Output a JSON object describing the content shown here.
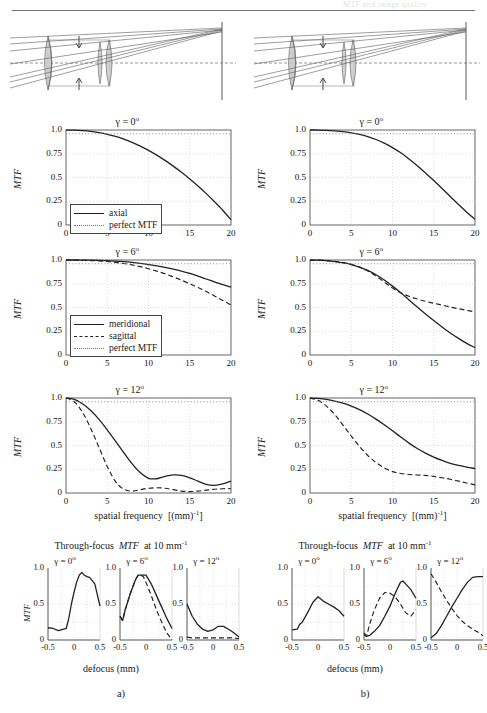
{
  "header": {
    "ghost_text": "MTF and image quality"
  },
  "figure": {
    "panels": [
      {
        "id": "a",
        "label": "a)"
      },
      {
        "id": "b",
        "label": "b)"
      }
    ],
    "axis": {
      "y_label": "MTF",
      "x_label_freq_pre": "spatial  frequency",
      "x_label_freq_unit": "[(mm)",
      "x_label_freq_exp": "-1",
      "x_label_freq_post": "]",
      "x_label_defocus": "defocus (mm)",
      "y_ticks": [
        "0",
        "0.25",
        "0.5",
        "0.75",
        "1.0"
      ],
      "x_ticks_freq": [
        "0",
        "5",
        "10",
        "15",
        "20"
      ],
      "y_ticks_tf": [
        "0",
        "0.5",
        "1.0"
      ],
      "x_ticks_tf": [
        "-0.5",
        "0",
        "0.5"
      ]
    },
    "titles": {
      "gamma0": "γ = 0",
      "gamma6": "γ = 6",
      "gamma12": "γ = 12",
      "degree": "o",
      "through_focus_pre": "Through-focus",
      "through_focus_mid": "MTF",
      "through_focus_post": "at  10  mm",
      "through_focus_exp": "-1"
    },
    "legends": {
      "axial": [
        {
          "style": "solid",
          "label": "axial"
        },
        {
          "style": "dot",
          "label": "perfect MTF"
        }
      ],
      "offaxis": [
        {
          "style": "solid",
          "label": "meridional"
        },
        {
          "style": "dash",
          "label": "sagittal"
        },
        {
          "style": "dot",
          "label": "perfect MTF"
        }
      ]
    },
    "colors": {
      "curve": "#222222",
      "perfect": "#8d8d8d",
      "grid": "#cfcfcf",
      "axis": "#555555",
      "lens_glass": "#c9c9c9",
      "lens_outline": "#6b6b6b",
      "ray": "#5c5c5c"
    }
  },
  "chart_data": [
    {
      "id": "a-gamma0",
      "type": "line",
      "title": "γ = 0°",
      "xlabel": "spatial frequency [(mm)^-1]",
      "ylabel": "MTF",
      "xlim": [
        0,
        20
      ],
      "ylim": [
        0,
        1
      ],
      "grid": true,
      "legend_position": "inside-bottom-left",
      "x": [
        0,
        1,
        2,
        3,
        4,
        5,
        6,
        7,
        8,
        9,
        10,
        11,
        12,
        13,
        14,
        15,
        16,
        17,
        18,
        19,
        20
      ],
      "series": [
        {
          "name": "axial",
          "style": "solid",
          "values": [
            1.0,
            0.998,
            0.993,
            0.985,
            0.972,
            0.955,
            0.932,
            0.904,
            0.87,
            0.83,
            0.785,
            0.735,
            0.68,
            0.62,
            0.555,
            0.485,
            0.41,
            0.33,
            0.245,
            0.155,
            0.055
          ]
        },
        {
          "name": "perfect MTF",
          "style": "dotted",
          "values": [
            0.96,
            0.96,
            0.96,
            0.96,
            0.96,
            0.96,
            0.96,
            0.96,
            0.96,
            0.96,
            0.96,
            0.96,
            0.96,
            0.96,
            0.96,
            0.96,
            0.96,
            0.96,
            0.96,
            0.96,
            0.96
          ]
        }
      ]
    },
    {
      "id": "b-gamma0",
      "type": "line",
      "title": "γ = 0°",
      "xlabel": "spatial frequency [(mm)^-1]",
      "ylabel": "MTF",
      "xlim": [
        0,
        20
      ],
      "ylim": [
        0,
        1
      ],
      "grid": true,
      "x": [
        0,
        1,
        2,
        3,
        4,
        5,
        6,
        7,
        8,
        9,
        10,
        11,
        12,
        13,
        14,
        15,
        16,
        17,
        18,
        19,
        20
      ],
      "series": [
        {
          "name": "axial",
          "style": "solid",
          "values": [
            1.0,
            0.999,
            0.996,
            0.99,
            0.982,
            0.97,
            0.953,
            0.93,
            0.9,
            0.862,
            0.815,
            0.76,
            0.695,
            0.625,
            0.548,
            0.468,
            0.385,
            0.3,
            0.215,
            0.135,
            0.06
          ]
        },
        {
          "name": "perfect MTF",
          "style": "dotted",
          "values": [
            0.96,
            0.96,
            0.96,
            0.96,
            0.96,
            0.96,
            0.96,
            0.96,
            0.96,
            0.96,
            0.96,
            0.96,
            0.96,
            0.96,
            0.96,
            0.96,
            0.96,
            0.96,
            0.96,
            0.96,
            0.96
          ]
        }
      ]
    },
    {
      "id": "a-gamma6",
      "type": "line",
      "title": "γ = 6°",
      "xlabel": "spatial frequency [(mm)^-1]",
      "ylabel": "MTF",
      "xlim": [
        0,
        20
      ],
      "ylim": [
        0,
        1
      ],
      "grid": true,
      "legend_position": "inside-bottom-left",
      "x": [
        0,
        1,
        2,
        3,
        4,
        5,
        6,
        7,
        8,
        9,
        10,
        11,
        12,
        13,
        14,
        15,
        16,
        17,
        18,
        19,
        20
      ],
      "series": [
        {
          "name": "meridional",
          "style": "solid",
          "values": [
            1.0,
            1.0,
            0.999,
            0.998,
            0.996,
            0.993,
            0.988,
            0.982,
            0.974,
            0.964,
            0.952,
            0.938,
            0.922,
            0.903,
            0.882,
            0.858,
            0.83,
            0.8,
            0.77,
            0.74,
            0.715
          ]
        },
        {
          "name": "sagittal",
          "style": "dashed",
          "values": [
            1.0,
            0.999,
            0.997,
            0.994,
            0.99,
            0.984,
            0.975,
            0.963,
            0.948,
            0.93,
            0.908,
            0.883,
            0.855,
            0.822,
            0.788,
            0.75,
            0.71,
            0.668,
            0.622,
            0.575,
            0.525
          ]
        },
        {
          "name": "perfect MTF",
          "style": "dotted",
          "values": [
            0.96,
            0.96,
            0.96,
            0.96,
            0.96,
            0.96,
            0.96,
            0.96,
            0.96,
            0.96,
            0.96,
            0.96,
            0.96,
            0.96,
            0.96,
            0.96,
            0.96,
            0.96,
            0.96,
            0.96,
            0.96
          ]
        }
      ]
    },
    {
      "id": "b-gamma6",
      "type": "line",
      "title": "γ = 6°",
      "xlabel": "spatial frequency [(mm)^-1]",
      "ylabel": "MTF",
      "xlim": [
        0,
        20
      ],
      "ylim": [
        0,
        1
      ],
      "grid": true,
      "x": [
        0,
        1,
        2,
        3,
        4,
        5,
        6,
        7,
        8,
        9,
        10,
        11,
        12,
        13,
        14,
        15,
        16,
        17,
        18,
        19,
        20
      ],
      "series": [
        {
          "name": "meridional",
          "style": "solid",
          "values": [
            1.0,
            0.998,
            0.993,
            0.984,
            0.97,
            0.952,
            0.925,
            0.89,
            0.845,
            0.79,
            0.725,
            0.655,
            0.58,
            0.505,
            0.432,
            0.362,
            0.295,
            0.232,
            0.175,
            0.122,
            0.078
          ]
        },
        {
          "name": "sagittal",
          "style": "dashed",
          "values": [
            1.0,
            0.998,
            0.993,
            0.985,
            0.973,
            0.955,
            0.925,
            0.885,
            0.83,
            0.768,
            0.705,
            0.655,
            0.618,
            0.59,
            0.565,
            0.545,
            0.525,
            0.505,
            0.487,
            0.47,
            0.455
          ]
        },
        {
          "name": "perfect MTF",
          "style": "dotted",
          "values": [
            0.96,
            0.96,
            0.96,
            0.96,
            0.96,
            0.96,
            0.96,
            0.96,
            0.96,
            0.96,
            0.96,
            0.96,
            0.96,
            0.96,
            0.96,
            0.96,
            0.96,
            0.96,
            0.96,
            0.96,
            0.96
          ]
        }
      ]
    },
    {
      "id": "a-gamma12",
      "type": "line",
      "title": "γ = 12°",
      "xlabel": "spatial frequency [(mm)^-1]",
      "ylabel": "MTF",
      "xlim": [
        0,
        20
      ],
      "ylim": [
        0,
        1
      ],
      "grid": true,
      "x": [
        0,
        1,
        2,
        3,
        4,
        5,
        6,
        7,
        8,
        9,
        10,
        11,
        12,
        13,
        14,
        15,
        16,
        17,
        18,
        19,
        20
      ],
      "series": [
        {
          "name": "meridional",
          "style": "solid",
          "values": [
            1.0,
            0.985,
            0.94,
            0.868,
            0.775,
            0.665,
            0.545,
            0.425,
            0.31,
            0.215,
            0.155,
            0.15,
            0.175,
            0.19,
            0.185,
            0.16,
            0.125,
            0.09,
            0.08,
            0.095,
            0.125
          ]
        },
        {
          "name": "sagittal",
          "style": "dashed",
          "values": [
            1.0,
            0.96,
            0.85,
            0.68,
            0.48,
            0.28,
            0.12,
            0.04,
            0.02,
            0.035,
            0.05,
            0.055,
            0.05,
            0.035,
            0.02,
            0.015,
            0.02,
            0.03,
            0.04,
            0.045,
            0.045
          ]
        },
        {
          "name": "perfect MTF",
          "style": "dotted",
          "values": [
            0.96,
            0.96,
            0.96,
            0.96,
            0.96,
            0.96,
            0.96,
            0.96,
            0.96,
            0.96,
            0.96,
            0.96,
            0.96,
            0.96,
            0.96,
            0.96,
            0.96,
            0.96,
            0.96,
            0.96,
            0.96
          ]
        }
      ]
    },
    {
      "id": "b-gamma12",
      "type": "line",
      "title": "γ = 12°",
      "xlabel": "spatial frequency [(mm)^-1]",
      "ylabel": "MTF",
      "xlim": [
        0,
        20
      ],
      "ylim": [
        0,
        1
      ],
      "grid": true,
      "x": [
        0,
        1,
        2,
        3,
        4,
        5,
        6,
        7,
        8,
        9,
        10,
        11,
        12,
        13,
        14,
        15,
        16,
        17,
        18,
        19,
        20
      ],
      "series": [
        {
          "name": "meridional",
          "style": "solid",
          "values": [
            1.0,
            0.995,
            0.985,
            0.968,
            0.945,
            0.915,
            0.878,
            0.832,
            0.778,
            0.718,
            0.655,
            0.59,
            0.525,
            0.468,
            0.42,
            0.378,
            0.343,
            0.313,
            0.29,
            0.272,
            0.258
          ]
        },
        {
          "name": "sagittal",
          "style": "dashed",
          "values": [
            1.0,
            0.975,
            0.915,
            0.825,
            0.715,
            0.6,
            0.49,
            0.395,
            0.32,
            0.265,
            0.225,
            0.205,
            0.195,
            0.19,
            0.185,
            0.175,
            0.16,
            0.145,
            0.125,
            0.105,
            0.085
          ]
        },
        {
          "name": "perfect MTF",
          "style": "dotted",
          "values": [
            0.96,
            0.96,
            0.96,
            0.96,
            0.96,
            0.96,
            0.96,
            0.96,
            0.96,
            0.96,
            0.96,
            0.96,
            0.96,
            0.96,
            0.96,
            0.96,
            0.96,
            0.96,
            0.96,
            0.96,
            0.96
          ]
        }
      ]
    },
    {
      "id": "a-tf-gamma0",
      "type": "line",
      "title": "γ = 0°",
      "xlabel": "defocus (mm)",
      "ylabel": "MTF",
      "xlim": [
        -0.5,
        0.5
      ],
      "ylim": [
        0,
        1
      ],
      "grid": true,
      "x": [
        -0.5,
        -0.4,
        -0.3,
        -0.25,
        -0.2,
        -0.15,
        -0.1,
        -0.05,
        0,
        0.05,
        0.1,
        0.15,
        0.2,
        0.25,
        0.3,
        0.4,
        0.5
      ],
      "series": [
        {
          "name": "meridional",
          "style": "solid",
          "values": [
            0.17,
            0.16,
            0.13,
            0.14,
            0.15,
            0.16,
            0.3,
            0.5,
            0.66,
            0.8,
            0.9,
            0.94,
            0.9,
            0.88,
            0.87,
            0.78,
            0.47
          ]
        }
      ]
    },
    {
      "id": "a-tf-gamma6",
      "type": "line",
      "title": "γ = 6°",
      "xlabel": "defocus (mm)",
      "ylabel": "MTF",
      "xlim": [
        -0.5,
        0.5
      ],
      "ylim": [
        0,
        1
      ],
      "grid": true,
      "x": [
        -0.5,
        -0.45,
        -0.4,
        -0.3,
        -0.2,
        -0.15,
        -0.1,
        -0.05,
        0,
        0.1,
        0.2,
        0.3,
        0.4,
        0.5
      ],
      "series": [
        {
          "name": "meridional",
          "style": "solid",
          "values": [
            0.33,
            0.27,
            0.42,
            0.65,
            0.84,
            0.9,
            0.9,
            0.9,
            0.9,
            0.78,
            0.62,
            0.46,
            0.3,
            0.16
          ]
        },
        {
          "name": "sagittal",
          "style": "dashed",
          "values": [
            0.33,
            0.27,
            0.42,
            0.65,
            0.84,
            0.9,
            0.9,
            0.88,
            0.8,
            0.62,
            0.42,
            0.25,
            0.1,
            0.0
          ]
        }
      ]
    },
    {
      "id": "a-tf-gamma12",
      "type": "line",
      "title": "γ = 12°",
      "xlabel": "defocus (mm)",
      "ylabel": "MTF",
      "xlim": [
        -0.5,
        0.5
      ],
      "ylim": [
        0,
        1
      ],
      "grid": true,
      "x": [
        -0.5,
        -0.4,
        -0.3,
        -0.2,
        -0.1,
        0,
        0.1,
        0.2,
        0.3,
        0.4,
        0.5
      ],
      "series": [
        {
          "name": "meridional",
          "style": "solid",
          "values": [
            0.5,
            0.33,
            0.22,
            0.15,
            0.12,
            0.14,
            0.19,
            0.19,
            0.15,
            0.1,
            0.04
          ]
        },
        {
          "name": "sagittal",
          "style": "dashed",
          "values": [
            0.04,
            0.03,
            0.03,
            0.03,
            0.03,
            0.03,
            0.03,
            0.03,
            0.03,
            0.03,
            0.02
          ]
        }
      ]
    },
    {
      "id": "b-tf-gamma0",
      "type": "line",
      "title": "γ = 0°",
      "xlabel": "defocus (mm)",
      "ylabel": "MTF",
      "xlim": [
        -0.5,
        0.5
      ],
      "ylim": [
        0,
        1
      ],
      "grid": true,
      "x": [
        -0.5,
        -0.4,
        -0.35,
        -0.3,
        -0.2,
        -0.1,
        0,
        0.1,
        0.2,
        0.3,
        0.4,
        0.5
      ],
      "series": [
        {
          "name": "meridional",
          "style": "solid",
          "values": [
            0.14,
            0.15,
            0.22,
            0.25,
            0.38,
            0.52,
            0.6,
            0.54,
            0.5,
            0.46,
            0.41,
            0.33
          ]
        }
      ]
    },
    {
      "id": "b-tf-gamma6",
      "type": "line",
      "title": "γ = 6°",
      "xlabel": "defocus (mm)",
      "ylabel": "MTF",
      "xlim": [
        -0.5,
        0.5
      ],
      "ylim": [
        0,
        1
      ],
      "grid": true,
      "x": [
        -0.5,
        -0.45,
        -0.4,
        -0.3,
        -0.2,
        -0.1,
        0,
        0.1,
        0.2,
        0.25,
        0.3,
        0.4,
        0.5
      ],
      "series": [
        {
          "name": "meridional",
          "style": "solid",
          "values": [
            0.1,
            0.05,
            0.06,
            0.12,
            0.2,
            0.33,
            0.47,
            0.65,
            0.8,
            0.82,
            0.78,
            0.7,
            0.58
          ]
        },
        {
          "name": "sagittal",
          "style": "dashed",
          "values": [
            0.07,
            0.05,
            0.2,
            0.42,
            0.58,
            0.66,
            0.65,
            0.6,
            0.5,
            0.44,
            0.38,
            0.33,
            0.42
          ]
        }
      ]
    },
    {
      "id": "b-tf-gamma12",
      "type": "line",
      "title": "γ = 12°",
      "xlabel": "defocus (mm)",
      "ylabel": "MTF",
      "xlim": [
        -0.5,
        0.5
      ],
      "ylim": [
        0,
        1
      ],
      "grid": true,
      "x": [
        -0.5,
        -0.4,
        -0.3,
        -0.2,
        -0.1,
        0,
        0.1,
        0.2,
        0.3,
        0.4,
        0.5
      ],
      "series": [
        {
          "name": "meridional",
          "style": "solid",
          "values": [
            0.03,
            0.09,
            0.2,
            0.33,
            0.46,
            0.58,
            0.7,
            0.8,
            0.87,
            0.88,
            0.88
          ]
        },
        {
          "name": "sagittal",
          "style": "dashed",
          "values": [
            0.92,
            0.8,
            0.67,
            0.55,
            0.44,
            0.34,
            0.26,
            0.2,
            0.15,
            0.11,
            0.06
          ]
        }
      ]
    }
  ]
}
